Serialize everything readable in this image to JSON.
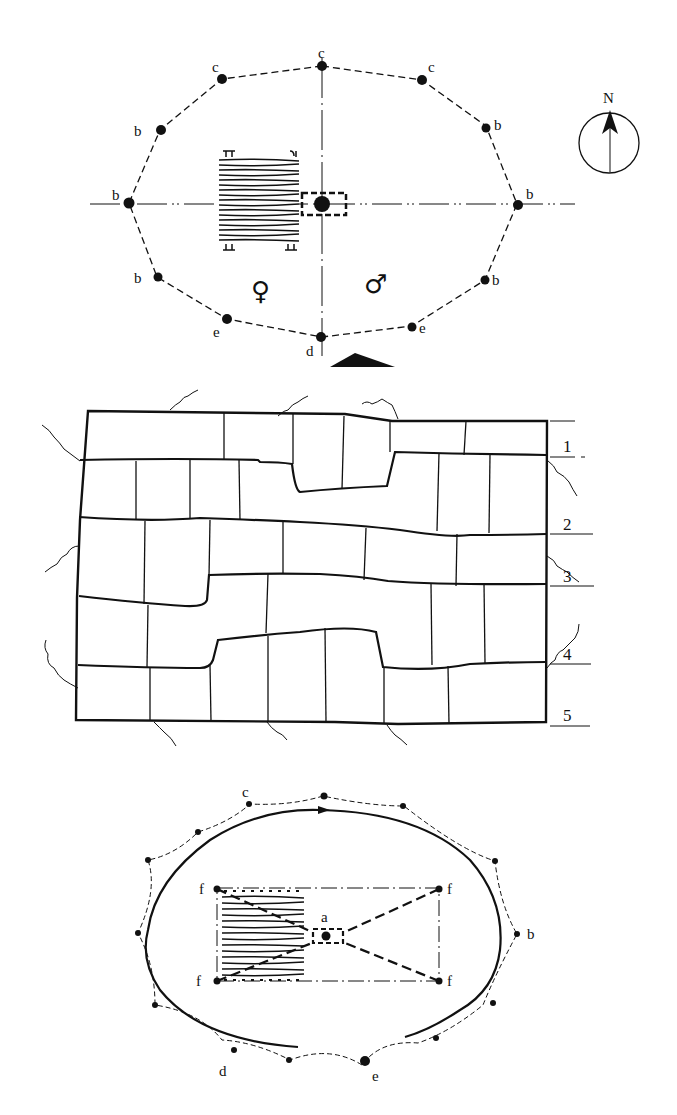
{
  "figure": {
    "panels": [
      {
        "id": "top-plan",
        "description": "Ceremonial site plan with boundary posts, central post, altar and sex-divided seating",
        "labels": {
          "c_top": "c",
          "c_left": "c",
          "c_right": "c",
          "b_ul": "b",
          "b_ur": "b",
          "b_left": "b",
          "b_right": "b",
          "b_ll": "b",
          "b_lr": "b",
          "e_left": "e",
          "e_right": "e",
          "d_bottom": "d"
        },
        "symbols": {
          "female": "♀",
          "male": "♂"
        },
        "compass": {
          "label": "N"
        }
      },
      {
        "id": "middle-grid",
        "description": "Plan of field/plot divisions with numbered rows",
        "row_labels": [
          "1",
          "2",
          "3",
          "4",
          "5"
        ]
      },
      {
        "id": "bottom-plan",
        "description": "Oval enclosure with boundary posts, central point and corner posts",
        "labels": {
          "c": "c",
          "b": "b",
          "d": "d",
          "e": "e",
          "a": "a",
          "f_tl": "f",
          "f_tr": "f",
          "f_bl": "f",
          "f_br": "f"
        }
      }
    ]
  },
  "colors": {
    "ink": "#111111",
    "background": "#ffffff"
  }
}
